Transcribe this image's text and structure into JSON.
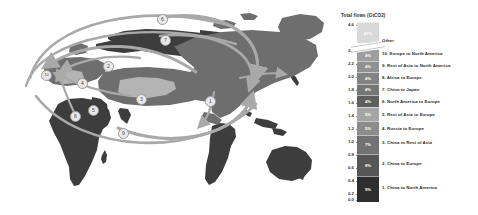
{
  "chart_data": {
    "type": "bar",
    "title": "Total flows (GtCO2)",
    "ylabel": "Total flows (GtCO2)",
    "xlabel": "",
    "ylim": [
      0.0,
      4.6
    ],
    "axis_break": true,
    "grid": false,
    "legend_position": "right",
    "orientation": "vertical-stacked",
    "tick_labels": [
      "4.6",
      "2.4",
      "2.2",
      "2.0",
      "1.8",
      "1.6",
      "1.4",
      "1.2",
      "1.0",
      "0.8",
      "0.6",
      "0.4",
      "0.2",
      "0.0"
    ],
    "tick_values": [
      4.6,
      2.4,
      2.2,
      2.0,
      1.8,
      1.6,
      1.4,
      1.2,
      1.0,
      0.8,
      0.6,
      0.4,
      0.2,
      0.0
    ],
    "categories": [
      "Other",
      "10. Europe to North America",
      "9. Rest of Asia to North America",
      "8. Africa to Europe",
      "7. China to Japan",
      "6. North America to Europe",
      "5. Rest of Asia to Europe",
      "4. Russia to Europe",
      "3. China to Rest of Asia",
      "2. China to Europe",
      "1. China to North America"
    ],
    "values": [
      2.2,
      0.1,
      0.1,
      0.1,
      0.1,
      0.1,
      0.15,
      0.15,
      0.2,
      0.3,
      0.4
    ],
    "share_labels": [
      "47%",
      "4%",
      "4%",
      "4%",
      "4%",
      "4%",
      "5%",
      "5%",
      "7%",
      "8%",
      "9%"
    ],
    "segment_colors": [
      "#d7d7d7",
      "#9c9c9c",
      "#8e8e8e",
      "#808080",
      "#737373",
      "#5e5e5e",
      "#a2a2a2",
      "#8a8a8a",
      "#707070",
      "#585858",
      "#2f2f2f"
    ]
  },
  "chart": {
    "title": "Total flows (GtCO2)",
    "ticks": [
      {
        "label": "4.6",
        "top": 2
      },
      {
        "label": "2.4",
        "top": 28
      },
      {
        "label": "2.2",
        "top": 41
      },
      {
        "label": "2.0",
        "top": 54
      },
      {
        "label": "1.8",
        "top": 67
      },
      {
        "label": "1.6",
        "top": 80
      },
      {
        "label": "1.4",
        "top": 93
      },
      {
        "label": "1.2",
        "top": 106
      },
      {
        "label": "1.0",
        "top": 119
      },
      {
        "label": "0.8",
        "top": 132
      },
      {
        "label": "0.6",
        "top": 145
      },
      {
        "label": "0.4",
        "top": 158
      },
      {
        "label": "0.2",
        "top": 171
      },
      {
        "label": "0.0",
        "top": 177
      }
    ],
    "segments": [
      {
        "label": "Other",
        "share": "47%",
        "color": "#d9d9d9",
        "top": 0,
        "height": 21
      },
      {
        "label": "10. Europe to North America",
        "share": "4%",
        "color": "#9e9e9e",
        "top": 27,
        "height": 11.5
      },
      {
        "label": "9. Rest of Asia to North America",
        "share": "4%",
        "color": "#919191",
        "top": 38.5,
        "height": 11.5
      },
      {
        "label": "8. Africa to Europe",
        "share": "4%",
        "color": "#838383",
        "top": 50,
        "height": 11.5
      },
      {
        "label": "7. China to Japan",
        "share": "4%",
        "color": "#767676",
        "top": 61.5,
        "height": 11.5
      },
      {
        "label": "6. North America to Europe",
        "share": "4%",
        "color": "#5f5f5f",
        "top": 73,
        "height": 11.5
      },
      {
        "label": "5. Rest of Asia to Europe",
        "share": "5%",
        "color": "#a5a5a5",
        "top": 84.5,
        "height": 14
      },
      {
        "label": "4. Russia to Europe",
        "share": "5%",
        "color": "#8c8c8c",
        "top": 98.5,
        "height": 14
      },
      {
        "label": "3. China to Rest of Asia",
        "share": "7%",
        "color": "#727272",
        "top": 112.5,
        "height": 19
      },
      {
        "label": "2. China to Europe",
        "share": "8%",
        "color": "#565656",
        "top": 131.5,
        "height": 22
      },
      {
        "label": "1. China to North America",
        "share": "9%",
        "color": "#2e2e2e",
        "top": 153.5,
        "height": 26
      }
    ],
    "labels": [
      {
        "text": "Other",
        "top": 16
      },
      {
        "text": "10. Europe to North America",
        "top": 29
      },
      {
        "text": "9. Rest of Asia to North America",
        "top": 41
      },
      {
        "text": "8. Africa to Europe",
        "top": 53
      },
      {
        "text": "7. China to Japan",
        "top": 65
      },
      {
        "text": "6. North America to Europe",
        "top": 77
      },
      {
        "text": "5. Rest of Asia to Europe",
        "top": 90
      },
      {
        "text": "4. Russia to Europe",
        "top": 104
      },
      {
        "text": "3. China to Rest of Asia",
        "top": 118
      },
      {
        "text": "2. China to Europe",
        "top": 139
      },
      {
        "text": "1. China to North America",
        "top": 163
      }
    ]
  },
  "map": {
    "markers": [
      {
        "n": "1",
        "left": 205,
        "top": 96
      },
      {
        "n": "2",
        "left": 103,
        "top": 61
      },
      {
        "n": "3",
        "left": 136,
        "top": 94
      },
      {
        "n": "4",
        "left": 77,
        "top": 78
      },
      {
        "n": "5",
        "left": 88,
        "top": 105
      },
      {
        "n": "6",
        "left": 157,
        "top": 14
      },
      {
        "n": "7",
        "left": 160,
        "top": 35
      },
      {
        "n": "8",
        "left": 70,
        "top": 111
      },
      {
        "n": "9",
        "left": 118,
        "top": 128
      },
      {
        "n": "10",
        "left": 41,
        "top": 70
      }
    ],
    "land_dark": "#3d3d3d",
    "land_mid": "#6e6e6e",
    "land_light": "#b4b4b4",
    "arc_color": "#a9a9a9",
    "background": "#ffffff"
  }
}
